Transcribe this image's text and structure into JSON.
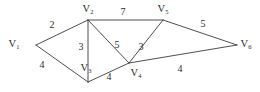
{
  "figure": {
    "background_color": "#ffffff",
    "line_color": "#3b3b3b",
    "text_color": "#2b2b2b"
  },
  "chart_data": {
    "type": "diagram",
    "graph_kind": "weighted-undirected-graph",
    "title": "",
    "xlabel": "",
    "ylabel": "",
    "nodes": [
      {
        "id": "V1",
        "label": "V",
        "subscript": "1",
        "x": 36,
        "y": 45,
        "label_x": 14,
        "label_y": 45
      },
      {
        "id": "V2",
        "label": "V",
        "subscript": "2",
        "x": 88,
        "y": 20,
        "label_x": 88,
        "label_y": 10
      },
      {
        "id": "V3",
        "label": "V",
        "subscript": "3",
        "x": 88,
        "y": 82,
        "label_x": 86,
        "label_y": 69
      },
      {
        "id": "V4",
        "label": "V",
        "subscript": "4",
        "x": 129,
        "y": 63,
        "label_x": 136,
        "label_y": 74
      },
      {
        "id": "V5",
        "label": "V",
        "subscript": "5",
        "x": 163,
        "y": 20,
        "label_x": 163,
        "label_y": 10
      },
      {
        "id": "V6",
        "label": "V",
        "subscript": "6",
        "x": 237,
        "y": 45,
        "label_x": 246,
        "label_y": 45
      }
    ],
    "edges": [
      {
        "source": "V1",
        "target": "V2",
        "weight": 2,
        "label_x": 52,
        "label_y": 26
      },
      {
        "source": "V1",
        "target": "V3",
        "weight": 4,
        "label_x": 42,
        "label_y": 66
      },
      {
        "source": "V2",
        "target": "V3",
        "weight": 3,
        "label_x": 81,
        "label_y": 48
      },
      {
        "source": "V2",
        "target": "V4",
        "weight": 5,
        "label_x": 117,
        "label_y": 46
      },
      {
        "source": "V2",
        "target": "V5",
        "weight": 7,
        "label_x": 123,
        "label_y": 13
      },
      {
        "source": "V3",
        "target": "V4",
        "weight": 4,
        "label_x": 109,
        "label_y": 78
      },
      {
        "source": "V4",
        "target": "V5",
        "weight": 3,
        "label_x": 141,
        "label_y": 48
      },
      {
        "source": "V4",
        "target": "V6",
        "weight": 4,
        "label_x": 180,
        "label_y": 70
      },
      {
        "source": "V5",
        "target": "V6",
        "weight": 5,
        "label_x": 203,
        "label_y": 25
      }
    ],
    "vertex_labels": [
      "V1",
      "V2",
      "V3",
      "V4",
      "V5",
      "V6"
    ],
    "weights": [
      2,
      4,
      3,
      5,
      7,
      4,
      3,
      4,
      5
    ],
    "legend": [],
    "grid": false
  }
}
